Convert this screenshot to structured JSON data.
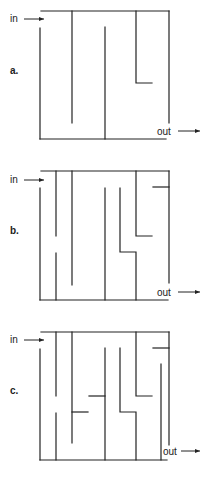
{
  "mazes": [
    {
      "id": "a",
      "label": "a.",
      "entry_label": "in",
      "exit_label": "out"
    },
    {
      "id": "b",
      "label": "b.",
      "entry_label": "in",
      "exit_label": "out"
    },
    {
      "id": "c",
      "label": "c.",
      "entry_label": "in",
      "exit_label": "out"
    }
  ],
  "arrow_icon": "right-arrow"
}
